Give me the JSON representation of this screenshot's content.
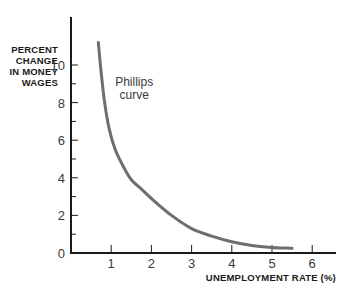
{
  "chart_data": {
    "type": "line",
    "title": "",
    "xlabel": "UNEMPLOYMENT RATE (%)",
    "ylabel": "PERCENT CHANGE IN MONEY WAGES",
    "ylabel_lines": [
      "PERCENT",
      "CHANGE",
      "IN MONEY",
      "WAGES"
    ],
    "xlim": [
      0,
      6.5
    ],
    "ylim": [
      0,
      12
    ],
    "xticks": [
      1,
      2,
      3,
      4,
      5,
      6
    ],
    "yticks": [
      0,
      2,
      4,
      6,
      8,
      10
    ],
    "yminor_ticks": [
      1,
      3,
      5,
      7,
      9
    ],
    "grid": false,
    "legend": null,
    "series": [
      {
        "name": "Phillips curve",
        "color": "#6e6e6e",
        "x": [
          0.68,
          0.75,
          0.83,
          0.95,
          1.1,
          1.3,
          1.5,
          1.75,
          2.0,
          2.5,
          3.0,
          3.5,
          4.0,
          4.5,
          5.0,
          5.5
        ],
        "y": [
          11.2,
          9.6,
          8.1,
          6.6,
          5.5,
          4.6,
          3.9,
          3.4,
          2.9,
          2.0,
          1.3,
          0.9,
          0.6,
          0.4,
          0.3,
          0.25
        ]
      }
    ],
    "annotations": [
      {
        "text_lines": [
          "Phillips",
          "curve"
        ],
        "x": 0.95,
        "y": 8.9
      }
    ]
  }
}
